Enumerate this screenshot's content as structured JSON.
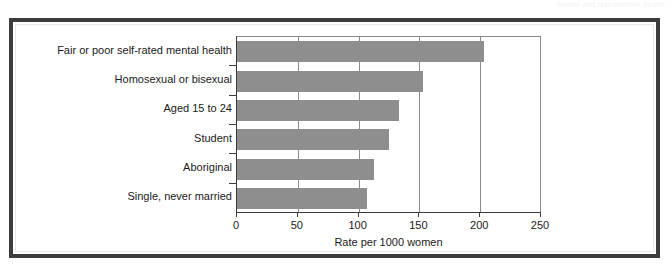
{
  "page": {
    "header_fragment": "Sexual and reproductive health"
  },
  "chart_data": {
    "type": "bar",
    "orientation": "horizontal",
    "title": "",
    "subtitle": "",
    "xlabel": "Rate per 1000 women",
    "ylabel": "",
    "categories": [
      "Fair or poor self-rated mental health",
      "Homosexual or bisexual",
      "Aged 15 to 24",
      "Student",
      "Aboriginal",
      "Single, never married"
    ],
    "values": [
      203,
      153,
      133,
      125,
      113,
      107
    ],
    "xlim": [
      0,
      250
    ],
    "xticks": [
      0,
      50,
      100,
      150,
      200,
      250
    ],
    "xtick_labels": [
      "0",
      "50",
      "100",
      "150",
      "200",
      "250"
    ],
    "grid": "vertical",
    "legend": "none",
    "bar_color": "#8e8e8e",
    "axis_color": "#3a3a3a",
    "grid_color": "#8a8a8a",
    "frame_color": "#3d3d3d"
  }
}
